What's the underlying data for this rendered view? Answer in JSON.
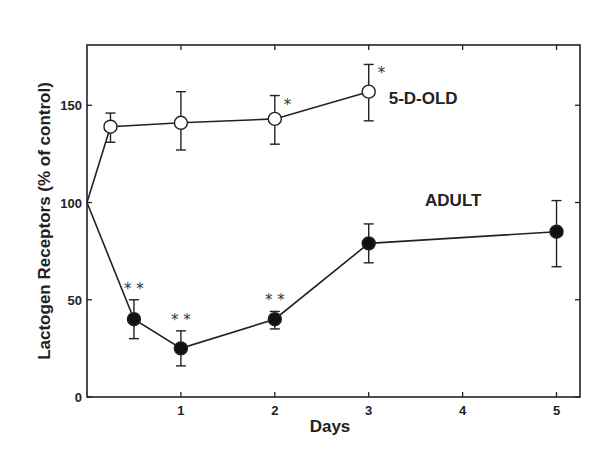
{
  "chart_data": {
    "type": "line",
    "title": "",
    "xlabel": "Days",
    "ylabel": "Lactogen  Receptors  (% of  control)",
    "xlim": [
      0,
      5.25
    ],
    "ylim": [
      0,
      181
    ],
    "xticks": [
      1,
      2,
      3,
      4,
      5
    ],
    "xtick_labels": [
      "1",
      "2",
      "3",
      "4",
      "5"
    ],
    "yticks": [
      0,
      50,
      100,
      150
    ],
    "ytick_labels": [
      "0",
      "50",
      "100",
      "150"
    ],
    "grid": false,
    "legend": "none (inline series labels)",
    "series": [
      {
        "name": "5-D-OLD",
        "marker": "open-circle",
        "x": [
          0,
          0.25,
          1,
          2,
          3
        ],
        "y": [
          100,
          139,
          141,
          143,
          157
        ],
        "err_low": [
          null,
          131,
          127,
          130,
          142
        ],
        "err_high": [
          null,
          146,
          157,
          155,
          171
        ],
        "significance": [
          "",
          "",
          "",
          "*",
          "*"
        ]
      },
      {
        "name": "ADULT",
        "marker": "filled-circle",
        "x": [
          0,
          0.5,
          1,
          2,
          3,
          5
        ],
        "y": [
          100,
          40,
          25,
          40,
          79,
          85
        ],
        "err_low": [
          null,
          30,
          16,
          35,
          69,
          67
        ],
        "err_high": [
          null,
          50,
          34,
          44,
          89,
          101
        ],
        "significance": [
          "",
          "**",
          "**",
          "**",
          "",
          ""
        ]
      }
    ]
  }
}
